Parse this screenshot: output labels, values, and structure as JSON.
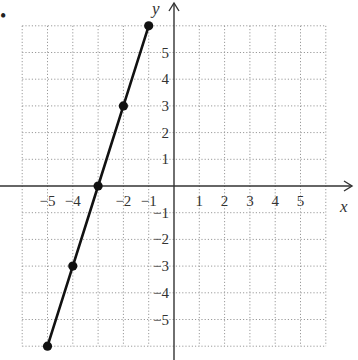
{
  "chart_data": {
    "type": "line",
    "title": "",
    "xlabel": "x",
    "ylabel": "y",
    "xlim": [
      -6,
      6
    ],
    "ylim": [
      -6,
      6
    ],
    "grid": true,
    "x_ticks": [
      -5,
      -4,
      -2,
      -1,
      1,
      2,
      3,
      4,
      5
    ],
    "x_tick_labels": [
      "−5",
      "−4",
      "−2",
      "−1",
      "1",
      "2",
      "3",
      "4",
      "5"
    ],
    "y_ticks": [
      5,
      4,
      3,
      2,
      1,
      -1,
      -2,
      -3,
      -4,
      -5
    ],
    "y_tick_labels": [
      "5",
      "4",
      "3",
      "2",
      "1",
      "−1",
      "−2",
      "−3",
      "−4",
      "−5"
    ],
    "series": [
      {
        "name": "line",
        "x": [
          -5,
          -4,
          -3,
          -2,
          -1
        ],
        "y": [
          -6,
          -3,
          0,
          3,
          6
        ],
        "markers": true
      }
    ],
    "colors": {
      "line": "#111111",
      "grid": "#9a9a9a",
      "axis": "#333333"
    }
  },
  "labels": {
    "x_axis": "x",
    "y_axis": "y",
    "bullet": "•"
  }
}
